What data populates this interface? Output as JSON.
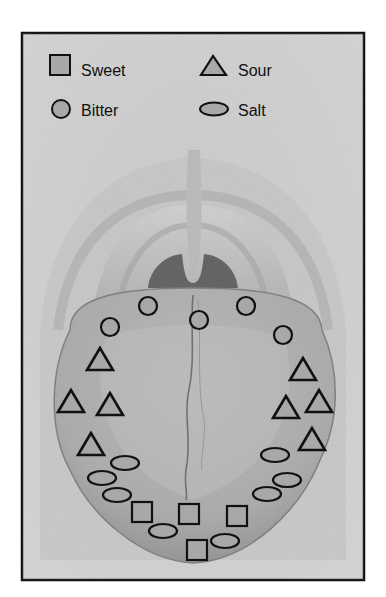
{
  "figure": {
    "frame": {
      "x": 22,
      "y": 33,
      "width": 342,
      "height": 547
    },
    "colors": {
      "frame_border": "#111111",
      "background": "#cfcfcf",
      "marker_fill": "#a8a8a8",
      "marker_stroke": "#111111",
      "throat_dark": "#5a5a5a",
      "tongue": "#b4b4b4",
      "tongue_shadow": "#8e8e8e",
      "palate": "#c4c4c4"
    }
  },
  "legend": {
    "items": [
      {
        "label": "Sweet",
        "shape": "square-icon"
      },
      {
        "label": "Sour",
        "shape": "triangle-icon"
      },
      {
        "label": "Bitter",
        "shape": "circle-icon"
      },
      {
        "label": "Salt",
        "shape": "ellipse-icon"
      }
    ]
  },
  "markers": {
    "bitter": [
      {
        "x": 148,
        "y": 306
      },
      {
        "x": 199,
        "y": 320
      },
      {
        "x": 246,
        "y": 306
      },
      {
        "x": 110,
        "y": 327
      },
      {
        "x": 283,
        "y": 335
      }
    ],
    "sour": [
      {
        "x": 100,
        "y": 360
      },
      {
        "x": 71,
        "y": 402
      },
      {
        "x": 110,
        "y": 405
      },
      {
        "x": 91,
        "y": 445
      },
      {
        "x": 303,
        "y": 370
      },
      {
        "x": 286,
        "y": 408
      },
      {
        "x": 319,
        "y": 402
      },
      {
        "x": 312,
        "y": 440
      }
    ],
    "salt": [
      {
        "x": 125,
        "y": 463
      },
      {
        "x": 102,
        "y": 478
      },
      {
        "x": 117,
        "y": 495
      },
      {
        "x": 275,
        "y": 455
      },
      {
        "x": 287,
        "y": 480
      },
      {
        "x": 267,
        "y": 494
      },
      {
        "x": 163,
        "y": 531
      },
      {
        "x": 225,
        "y": 541
      }
    ],
    "sweet": [
      {
        "x": 142,
        "y": 512
      },
      {
        "x": 189,
        "y": 514
      },
      {
        "x": 237,
        "y": 516
      },
      {
        "x": 197,
        "y": 550
      }
    ]
  }
}
